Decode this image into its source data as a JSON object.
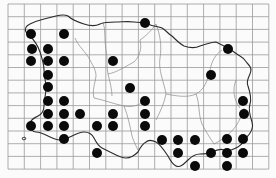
{
  "map": {
    "type": "distribution-map",
    "grid": {
      "x0": 8,
      "y0": 4,
      "cell_w": 16.3,
      "cell_h": 12.7,
      "cols": 16,
      "rows": 13,
      "line_color": "#9a9a9a"
    },
    "colors": {
      "background": "#fbfbfb",
      "coast": "#2a2a2a",
      "boundary": "#8a8a8a",
      "dot": "#0a0a0a"
    },
    "dot_radius": 5,
    "dots": [
      [
        31,
        34
      ],
      [
        64,
        34
      ],
      [
        32,
        49
      ],
      [
        48,
        49
      ],
      [
        31,
        61
      ],
      [
        48,
        61
      ],
      [
        64,
        61
      ],
      [
        113,
        61
      ],
      [
        48,
        75
      ],
      [
        130,
        88
      ],
      [
        48,
        87
      ],
      [
        145,
        23
      ],
      [
        228,
        49
      ],
      [
        211,
        75
      ],
      [
        48,
        101
      ],
      [
        64,
        101
      ],
      [
        48,
        114
      ],
      [
        64,
        114
      ],
      [
        80,
        114
      ],
      [
        113,
        114
      ],
      [
        31,
        126
      ],
      [
        48,
        126
      ],
      [
        64,
        126
      ],
      [
        97,
        126
      ],
      [
        113,
        126
      ],
      [
        64,
        139
      ],
      [
        97,
        153
      ],
      [
        145,
        101
      ],
      [
        145,
        114
      ],
      [
        145,
        126
      ],
      [
        162,
        140
      ],
      [
        178,
        140
      ],
      [
        195,
        140
      ],
      [
        227,
        139
      ],
      [
        243,
        139
      ],
      [
        178,
        153
      ],
      [
        211,
        153
      ],
      [
        227,
        153
      ],
      [
        243,
        153
      ],
      [
        195,
        166
      ],
      [
        227,
        166
      ],
      [
        243,
        101
      ],
      [
        244,
        114
      ]
    ]
  }
}
